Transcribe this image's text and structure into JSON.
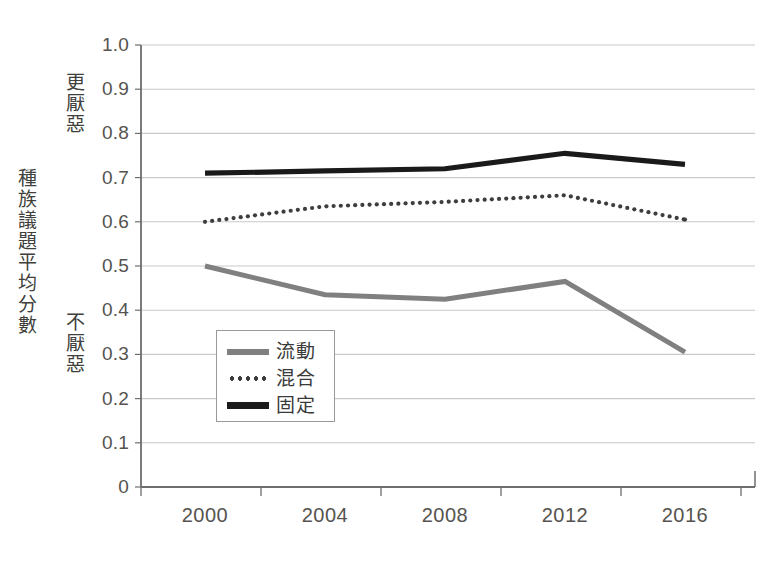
{
  "chart_data": {
    "type": "line",
    "title": "",
    "subtitle": "",
    "xlabel": "",
    "ylabel": "種族議題平均分數",
    "ylabel_note_high": "更厭惡",
    "ylabel_note_low": "不厭惡",
    "categories": [
      "2000",
      "2004",
      "2008",
      "2012",
      "2016"
    ],
    "x_tick_labels": [
      "2000",
      "2004",
      "2008",
      "2012",
      "2016"
    ],
    "y_tick_labels": [
      "1.0",
      "0.9",
      "0.8",
      "0.7",
      "0.6",
      "0.5",
      "0.4",
      "0.3",
      "0.2",
      "0.1",
      "0"
    ],
    "y_tick_values": [
      1.0,
      0.9,
      0.8,
      0.7,
      0.6,
      0.5,
      0.4,
      0.3,
      0.2,
      0.1,
      0
    ],
    "ylim": [
      0,
      1.0
    ],
    "grid": true,
    "grid_axis": "y",
    "legend_position": "inside-lower-left",
    "series": [
      {
        "name": "流動",
        "style": "solid",
        "color": "#808080",
        "values": [
          0.5,
          0.435,
          0.425,
          0.465,
          0.305
        ]
      },
      {
        "name": "混合",
        "style": "dotted",
        "color": "#3d3d3d",
        "values": [
          0.6,
          0.635,
          0.645,
          0.66,
          0.605
        ]
      },
      {
        "name": "固定",
        "style": "solid",
        "color": "#1a1a1a",
        "values": [
          0.71,
          0.715,
          0.72,
          0.755,
          0.73
        ]
      }
    ]
  },
  "legend": {
    "items": [
      {
        "label": "流動"
      },
      {
        "label": "混合"
      },
      {
        "label": "固定"
      }
    ]
  },
  "colors": {
    "axis": "#6e6e6e",
    "grid": "#c9c9c9",
    "text": "#55534f",
    "series_fluid": "#808080",
    "series_mixed": "#3d3d3d",
    "series_fixed": "#1a1a1a"
  }
}
